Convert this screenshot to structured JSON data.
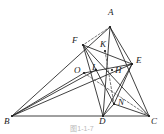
{
  "figure": {
    "caption": "图1-1-7",
    "stroke_color": "#2b2b2b",
    "label_color": "#1a1a1a",
    "background": "#ffffff"
  },
  "points": {
    "A": {
      "label": "A",
      "x": 110,
      "y": 27,
      "label_x": 108,
      "label_y": 8
    },
    "B": {
      "label": "B",
      "x": 12,
      "y": 116,
      "label_x": 4,
      "label_y": 117
    },
    "C": {
      "label": "C",
      "x": 149,
      "y": 116,
      "label_x": 151,
      "label_y": 117
    },
    "D": {
      "label": "D",
      "x": 103,
      "y": 116,
      "label_x": 99,
      "label_y": 117
    },
    "E": {
      "label": "E",
      "x": 132,
      "y": 64,
      "label_x": 136,
      "label_y": 56
    },
    "F": {
      "label": "F",
      "x": 83,
      "y": 45,
      "label_x": 72,
      "label_y": 36
    },
    "H": {
      "label": "H",
      "x": 112,
      "y": 70,
      "label_x": 115,
      "label_y": 66
    },
    "K": {
      "label": "K",
      "x": 105,
      "y": 51,
      "label_x": 100,
      "label_y": 40
    },
    "L": {
      "label": "L",
      "x": 96,
      "y": 70,
      "label_x": 92,
      "label_y": 63
    },
    "N": {
      "label": "N",
      "x": 114,
      "y": 104,
      "label_x": 118,
      "label_y": 98
    },
    "O": {
      "label": "O",
      "x": 84,
      "y": 73,
      "label_x": 74,
      "label_y": 66
    }
  },
  "segments_solid": [
    {
      "name": "side-BC",
      "from": "B",
      "to": "C"
    },
    {
      "name": "side-AB",
      "from": "B",
      "to": "A"
    },
    {
      "name": "side-AC",
      "from": "A",
      "to": "C"
    },
    {
      "name": "cevian-AD",
      "from": "A",
      "to": "D"
    },
    {
      "name": "cevian-BE",
      "from": "B",
      "to": "E"
    },
    {
      "name": "cevian-CF",
      "from": "C",
      "to": "F"
    },
    {
      "name": "segment-FE",
      "from": "F",
      "to": "E"
    },
    {
      "name": "segment-FD",
      "from": "F",
      "to": "D"
    },
    {
      "name": "segment-ED",
      "from": "E",
      "to": "D"
    },
    {
      "name": "segment-FN",
      "from": "F",
      "to": "N"
    },
    {
      "name": "segment-EN",
      "from": "E",
      "to": "N"
    },
    {
      "name": "segment-BO",
      "from": "B",
      "to": "O"
    },
    {
      "name": "segment-BL",
      "from": "B",
      "to": "L"
    },
    {
      "name": "segment-OE",
      "from": "O",
      "to": "E"
    },
    {
      "name": "segment-AE",
      "from": "A",
      "to": "E"
    },
    {
      "name": "segment-DN",
      "from": "D",
      "to": "N"
    },
    {
      "name": "segment-CN",
      "from": "C",
      "to": "N"
    }
  ],
  "segments_dashed": [
    {
      "name": "dashed-AK-F",
      "from": "A",
      "to": "F"
    },
    {
      "name": "dashed-OC",
      "from": "O",
      "to": "C"
    },
    {
      "name": "dashed-KN",
      "from": "K",
      "to": "N"
    }
  ],
  "marked_points": [
    "A",
    "B",
    "C",
    "D",
    "E",
    "F",
    "H",
    "K",
    "L",
    "N",
    "O"
  ]
}
